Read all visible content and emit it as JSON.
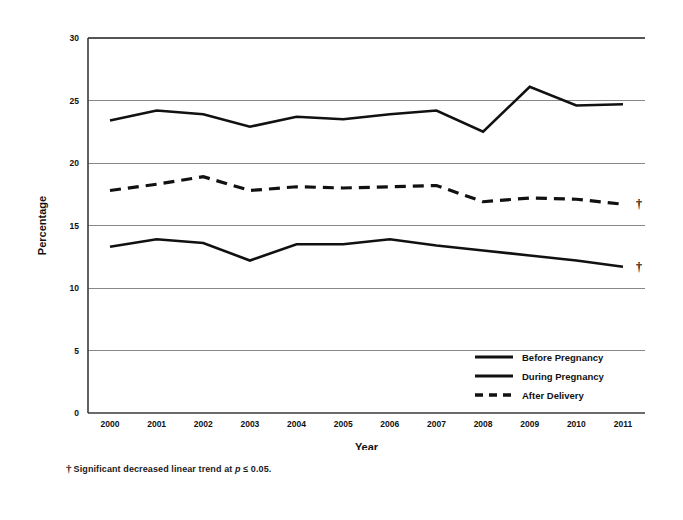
{
  "chart_data": {
    "type": "line",
    "title": "",
    "xlabel": "Year",
    "ylabel": "Percentage",
    "categories": [
      "2000",
      "2001",
      "2002",
      "2003",
      "2004",
      "2005",
      "2006",
      "2007",
      "2008",
      "2009",
      "2010",
      "2011"
    ],
    "ylim": [
      0,
      30
    ],
    "yticks": [
      "0",
      "5",
      "10",
      "15",
      "20",
      "25",
      "30"
    ],
    "ytick_values": [
      0,
      5,
      10,
      15,
      20,
      25,
      30
    ],
    "grid": true,
    "grid_axis": "y",
    "legend_position": "inside lower right",
    "series": [
      {
        "name": "Before Pregnancy",
        "style": "solid",
        "color": "#111111",
        "values": [
          13.3,
          13.9,
          13.6,
          12.2,
          13.5,
          13.5,
          13.9,
          13.4,
          13.0,
          12.6,
          12.2,
          11.7
        ],
        "annotation": "†"
      },
      {
        "name": "During Pregnancy",
        "style": "solid",
        "color": "#111111",
        "values": [
          23.4,
          24.2,
          23.9,
          22.9,
          23.7,
          23.5,
          23.9,
          24.2,
          22.5,
          26.1,
          24.6,
          24.7
        ],
        "annotation": ""
      },
      {
        "name": "After Delivery",
        "style": "dashed",
        "color": "#111111",
        "values": [
          17.8,
          18.3,
          18.9,
          17.8,
          18.1,
          18.0,
          18.1,
          18.2,
          16.9,
          17.2,
          17.1,
          16.7
        ],
        "annotation": "†"
      }
    ],
    "legend": [
      {
        "label": "Before Pregnancy",
        "style": "solid"
      },
      {
        "label": "During Pregnancy",
        "style": "solid"
      },
      {
        "label": "After Delivery",
        "style": "dashed"
      }
    ],
    "annotations": [
      {
        "marker": "†",
        "series": "After Delivery",
        "at_category": "2011"
      },
      {
        "marker": "†",
        "series": "Before Pregnancy",
        "at_category": "2011"
      }
    ]
  },
  "footnote": {
    "marker": "†",
    "text_before": "Significant decreased linear trend at ",
    "p_italic": "p",
    "text_after": " ≤ 0.05."
  }
}
